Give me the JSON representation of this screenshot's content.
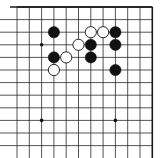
{
  "board": {
    "description": "Upper-right corner of a 19x19 Go board diagram",
    "visible_columns": 12,
    "visible_rows": 12,
    "origin_x": 17,
    "origin_y": 7,
    "spacing_x": 12.3,
    "spacing_y": 12.6,
    "line_color": "#2a2a2a",
    "edge_color": "#1a1a1a",
    "background": "#ffffff",
    "edges": {
      "top": true,
      "right": true,
      "left": false,
      "bottom": false
    },
    "star_points": [
      {
        "col": 2,
        "row": 3
      },
      {
        "col": 2,
        "row": 9
      },
      {
        "col": 8,
        "row": 9
      }
    ],
    "stones": [
      {
        "color": "black",
        "col": 3,
        "row": 2
      },
      {
        "color": "black",
        "col": 3,
        "row": 4
      },
      {
        "color": "white",
        "col": 4,
        "row": 4
      },
      {
        "color": "white",
        "col": 3,
        "row": 5
      },
      {
        "color": "white",
        "col": 5,
        "row": 3
      },
      {
        "color": "white",
        "col": 6,
        "row": 2
      },
      {
        "color": "white",
        "col": 7,
        "row": 2
      },
      {
        "color": "black",
        "col": 8,
        "row": 2
      },
      {
        "color": "black",
        "col": 6,
        "row": 3
      },
      {
        "color": "black",
        "col": 8,
        "row": 3
      },
      {
        "color": "black",
        "col": 6,
        "row": 4
      },
      {
        "color": "black",
        "col": 8,
        "row": 5
      }
    ]
  }
}
